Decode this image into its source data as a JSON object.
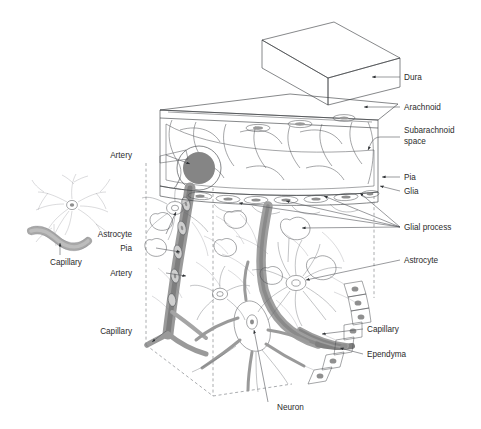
{
  "figure": {
    "background_color": "#ffffff",
    "label_color": "#2b2b2b",
    "leader_color": "#55585c",
    "outline_color": "#3a3d41",
    "dashed_edge_color": "#7c7f83"
  },
  "palette": {
    "dura_top": "#dcdcdc",
    "dura_front": "#c4c4c4",
    "dura_side": "#b2b2b2",
    "arachnoid_slab": "#f2f2f2",
    "subarachnoid_fill": "#fafafa",
    "artery_dark": "#8d8d8d",
    "vessel_mid": "#9e9e9e",
    "vessel_light": "#c9c9c9",
    "cell_body": "#c0c0c0",
    "nucleus": "#d8d8d8",
    "glial_process": "#eeeeee",
    "capillary_inset": "#a8a8a8"
  },
  "labels_right": [
    {
      "id": "dura",
      "text": "Dura",
      "x": 404,
      "y": 80
    },
    {
      "id": "arachnoid",
      "text": "Arachnoid",
      "x": 404,
      "y": 110
    },
    {
      "id": "subarachnoid-space",
      "text": "Subarachnoid",
      "text2": "space",
      "x": 404,
      "y": 133
    },
    {
      "id": "pia-right",
      "text": "Pia",
      "x": 404,
      "y": 180
    },
    {
      "id": "glia",
      "text": "Glia",
      "x": 404,
      "y": 194
    },
    {
      "id": "glial-process",
      "text": "Glial process",
      "x": 404,
      "y": 228
    },
    {
      "id": "astrocyte-right",
      "text": "Astrocyte",
      "x": 404,
      "y": 263
    },
    {
      "id": "capillary-right",
      "text": "Capillary",
      "x": 367,
      "y": 331
    },
    {
      "id": "ependyma",
      "text": "Ependyma",
      "x": 367,
      "y": 356
    }
  ],
  "labels_left": [
    {
      "id": "artery-upper",
      "text": "Artery",
      "x": 136,
      "y": 157
    },
    {
      "id": "astrocyte-left",
      "text": "Astrocyte",
      "x": 136,
      "y": 236
    },
    {
      "id": "pia-left",
      "text": "Pia",
      "x": 136,
      "y": 250
    },
    {
      "id": "artery-lower",
      "text": "Artery",
      "x": 136,
      "y": 275
    },
    {
      "id": "capillary-left",
      "text": "Capillary",
      "x": 136,
      "y": 333
    }
  ],
  "labels_bottom": [
    {
      "id": "neuron",
      "text": "Neuron",
      "x": 277,
      "y": 409
    }
  ],
  "inset": {
    "id": "astrocyte-capillary-inset",
    "capillary_label": "Capillary",
    "capillary_label_x": 66,
    "capillary_label_y": 262
  },
  "structures": [
    {
      "id": "dura-block",
      "name": "Dura",
      "kind": "3d-box"
    },
    {
      "id": "arachnoid-slab",
      "name": "Arachnoid",
      "kind": "slab"
    },
    {
      "id": "subarachnoid-space",
      "name": "Subarachnoid space",
      "kind": "void-with-trabeculae"
    },
    {
      "id": "pia-layer",
      "name": "Pia",
      "kind": "cell-row"
    },
    {
      "id": "glia-layer",
      "name": "Glia",
      "kind": "cell-row"
    },
    {
      "id": "artery",
      "name": "Artery",
      "kind": "vessel"
    },
    {
      "id": "capillary",
      "name": "Capillary",
      "kind": "vessel"
    },
    {
      "id": "astrocyte",
      "name": "Astrocyte",
      "kind": "cell"
    },
    {
      "id": "neuron",
      "name": "Neuron",
      "kind": "cell"
    },
    {
      "id": "ependyma",
      "name": "Ependyma",
      "kind": "cell-row"
    },
    {
      "id": "glial-process",
      "name": "Glial process",
      "kind": "process-endfoot"
    }
  ]
}
